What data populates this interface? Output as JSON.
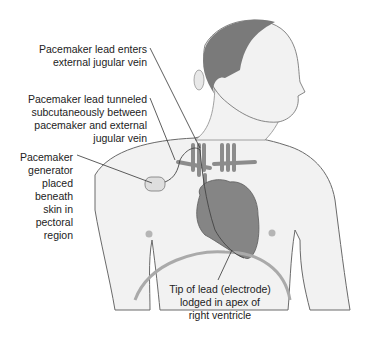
{
  "labels": {
    "lead_enters": {
      "lines": [
        "Pacemaker lead enters",
        "external jugular vein"
      ]
    },
    "lead_tunneled": {
      "lines": [
        "Pacemaker lead tunneled",
        "subcutaneously between",
        "pacemaker and external",
        "jugular vein"
      ]
    },
    "generator": {
      "lines": [
        "Pacemaker",
        "generator",
        "placed",
        "beneath",
        "skin in",
        "pectoral",
        "region"
      ]
    },
    "tip": {
      "lines": [
        "Tip of lead (electrode)",
        "lodged in apex of",
        "right ventricle"
      ]
    }
  },
  "colors": {
    "skin": "#f2f2f2",
    "outline": "#6a6a6a",
    "hair": "#7a7a7a",
    "vessel": "#8c8c8c",
    "heart": "#858585",
    "leader": "#333333"
  }
}
